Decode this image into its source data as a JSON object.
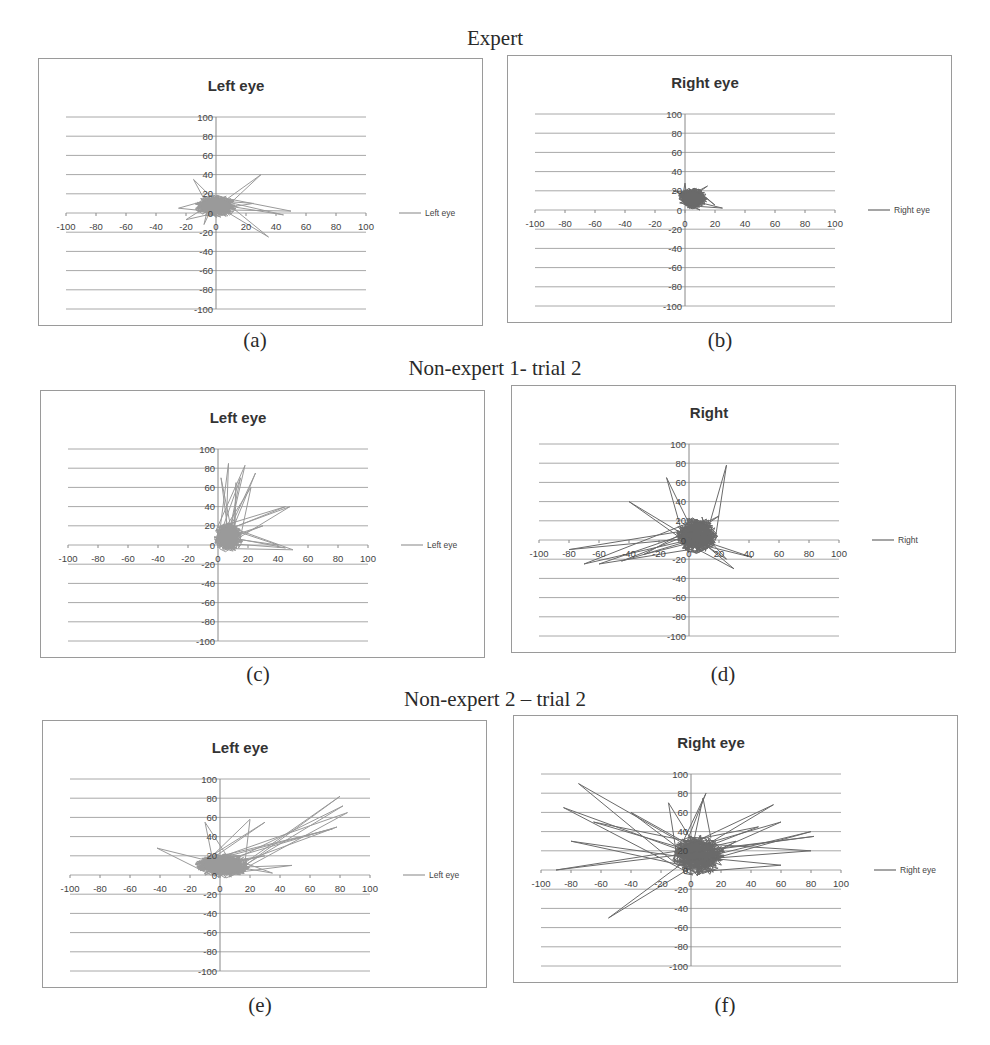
{
  "figure": {
    "rows": [
      {
        "heading": "Expert"
      },
      {
        "heading": "Non-expert 1- trial 2"
      },
      {
        "heading": "Non-expert 2 – trial 2"
      }
    ]
  },
  "colors": {
    "light_series": "#9a9a9a",
    "dark_series": "#6a6a6a",
    "grid": "#a8a8a8",
    "axis": "#888888",
    "border": "#9a9a9a"
  },
  "chart_data": [
    {
      "id": "a",
      "caption": "(a)",
      "row": "Expert",
      "type": "line",
      "title": "Left eye",
      "legend": "Left eye",
      "legend_position": "right",
      "xlim": [
        -100,
        100
      ],
      "ylim": [
        -100,
        100
      ],
      "xticks": [
        -100,
        -80,
        -60,
        -40,
        -20,
        0,
        20,
        40,
        60,
        80,
        100
      ],
      "yticks": [
        100,
        80,
        60,
        40,
        20,
        0,
        -20,
        -40,
        -60,
        -80,
        -100
      ],
      "grid": "horizontal",
      "description": "Gaze trajectory densely clustered around origin (approx. -15..15 x, -10..20 y) with a few saccade spikes to ~(30,40), (50,0), (35,-25), (-25,5)",
      "cluster": {
        "cx": 0,
        "cy": 7,
        "rx": 13,
        "ry": 11
      },
      "spikes": [
        [
          30,
          40
        ],
        [
          50,
          2
        ],
        [
          45,
          -2
        ],
        [
          35,
          -25
        ],
        [
          -25,
          5
        ],
        [
          -20,
          -7
        ],
        [
          -15,
          35
        ],
        [
          25,
          10
        ],
        [
          -8,
          -12
        ]
      ]
    },
    {
      "id": "b",
      "caption": "(b)",
      "row": "Expert",
      "type": "line",
      "title": "Right eye",
      "legend": "Right eye",
      "legend_position": "right",
      "xlim": [
        -100,
        100
      ],
      "ylim": [
        -100,
        100
      ],
      "xticks": [
        -100,
        -80,
        -60,
        -40,
        -20,
        0,
        20,
        40,
        60,
        80,
        100
      ],
      "yticks": [
        100,
        80,
        60,
        40,
        20,
        0,
        -20,
        -40,
        -60,
        -80,
        -100
      ],
      "grid": "horizontal",
      "description": "Compact dark cluster near origin (approx. -5..25 x, 0..28 y)",
      "cluster": {
        "cx": 5,
        "cy": 12,
        "rx": 9,
        "ry": 10
      },
      "spikes": [
        [
          25,
          2
        ],
        [
          0,
          28
        ],
        [
          -8,
          20
        ],
        [
          15,
          25
        ],
        [
          20,
          5
        ],
        [
          10,
          0
        ]
      ]
    },
    {
      "id": "c",
      "caption": "(c)",
      "row": "Non-expert 1- trial 2",
      "type": "line",
      "title": "Left eye",
      "legend": "Left eye",
      "legend_position": "right",
      "xlim": [
        -100,
        100
      ],
      "ylim": [
        -100,
        100
      ],
      "xticks": [
        -100,
        -80,
        -60,
        -40,
        -20,
        0,
        20,
        40,
        60,
        80,
        100
      ],
      "yticks": [
        100,
        80,
        60,
        40,
        20,
        0,
        -20,
        -40,
        -60,
        -80,
        -100
      ],
      "grid": "horizontal",
      "description": "Trajectory mostly in first quadrant (x 0..20, y 0..30) with long vertical saccades up to ~85 and excursions to x~50",
      "cluster": {
        "cx": 7,
        "cy": 8,
        "rx": 9,
        "ry": 14
      },
      "spikes": [
        [
          7,
          85
        ],
        [
          18,
          83
        ],
        [
          25,
          75
        ],
        [
          2,
          70
        ],
        [
          15,
          70
        ],
        [
          45,
          40
        ],
        [
          48,
          40
        ],
        [
          50,
          -5
        ],
        [
          45,
          -3
        ],
        [
          40,
          0
        ],
        [
          30,
          20
        ],
        [
          22,
          60
        ],
        [
          12,
          65
        ]
      ]
    },
    {
      "id": "d",
      "caption": "(d)",
      "row": "Non-expert 1- trial 2",
      "type": "line",
      "title": "Right",
      "legend": "Right",
      "legend_position": "right",
      "xlim": [
        -100,
        100
      ],
      "ylim": [
        -100,
        100
      ],
      "xticks": [
        -100,
        -80,
        -60,
        -40,
        -20,
        0,
        20,
        40,
        60,
        80,
        100
      ],
      "yticks": [
        100,
        80,
        60,
        40,
        20,
        0,
        -20,
        -40,
        -60,
        -80,
        -100
      ],
      "grid": "horizontal",
      "description": "Dense dark cluster at origin (x -10..25, y -25..40) with polygonal excursions to the left (x -80..-20, y -25..40), a tall triangle peaking at (25,78) and reaching (42,-18), spike to (-15,65)",
      "cluster": {
        "cx": 5,
        "cy": 5,
        "rx": 13,
        "ry": 18
      },
      "spikes": [
        [
          25,
          78
        ],
        [
          42,
          -18
        ],
        [
          -15,
          65
        ],
        [
          -40,
          40
        ],
        [
          -80,
          -10
        ],
        [
          -70,
          -25
        ],
        [
          -60,
          -25
        ],
        [
          -45,
          -22
        ],
        [
          -30,
          -15
        ],
        [
          20,
          25
        ],
        [
          30,
          -30
        ],
        [
          25,
          -20
        ]
      ]
    },
    {
      "id": "e",
      "caption": "(e)",
      "row": "Non-expert 2 – trial 2",
      "type": "line",
      "title": "Left eye",
      "legend": "Left eye",
      "legend_position": "right",
      "xlim": [
        -100,
        100
      ],
      "ylim": [
        -100,
        100
      ],
      "xticks": [
        -100,
        -80,
        -60,
        -40,
        -20,
        0,
        20,
        40,
        60,
        80,
        100
      ],
      "yticks": [
        100,
        80,
        60,
        40,
        20,
        0,
        -20,
        -40,
        -60,
        -80,
        -100
      ],
      "grid": "horizontal",
      "description": "Dense light cluster near origin (x -20..30, y -10..30) with long excursion loop to (80,82)-(85,65)-(75,48)",
      "cluster": {
        "cx": 2,
        "cy": 10,
        "rx": 17,
        "ry": 12
      },
      "spikes": [
        [
          -42,
          28
        ],
        [
          48,
          10
        ],
        [
          35,
          2
        ],
        [
          30,
          55
        ],
        [
          20,
          58
        ],
        [
          -10,
          55
        ],
        [
          80,
          82
        ],
        [
          85,
          65
        ],
        [
          78,
          50
        ],
        [
          75,
          48
        ],
        [
          82,
          72
        ],
        [
          30,
          20
        ]
      ]
    },
    {
      "id": "f",
      "caption": "(f)",
      "row": "Non-expert 2 – trial 2",
      "type": "line",
      "title": "Right eye",
      "legend": "Right eye",
      "legend_position": "right",
      "xlim": [
        -100,
        100
      ],
      "ylim": [
        -100,
        100
      ],
      "xticks": [
        -100,
        -80,
        -60,
        -40,
        -20,
        0,
        20,
        40,
        60,
        80,
        100
      ],
      "yticks": [
        100,
        80,
        60,
        40,
        20,
        0,
        -20,
        -40,
        -60,
        -80,
        -100
      ],
      "grid": "horizontal",
      "description": "Widely scattered dark trajectory spanning x -90..85, y -50..90 with dense core near (5,15)",
      "cluster": {
        "cx": 5,
        "cy": 15,
        "rx": 16,
        "ry": 20
      },
      "spikes": [
        [
          -75,
          90
        ],
        [
          -90,
          0
        ],
        [
          -85,
          65
        ],
        [
          -65,
          50
        ],
        [
          -80,
          30
        ],
        [
          -55,
          -50
        ],
        [
          10,
          80
        ],
        [
          8,
          75
        ],
        [
          55,
          68
        ],
        [
          60,
          50
        ],
        [
          80,
          40
        ],
        [
          82,
          35
        ],
        [
          80,
          20
        ],
        [
          60,
          5
        ],
        [
          45,
          45
        ],
        [
          30,
          30
        ],
        [
          -15,
          70
        ],
        [
          -40,
          60
        ]
      ]
    }
  ]
}
